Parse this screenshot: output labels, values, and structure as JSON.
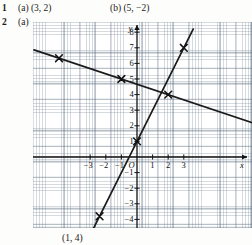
{
  "page": {
    "width": 252,
    "height": 245,
    "background": "#fdfdfb",
    "ink": "#1a1a1a"
  },
  "exercises": [
    {
      "number": "1",
      "parts": [
        {
          "label": "(a)",
          "answer": "(3, 2)"
        },
        {
          "label": "(b)",
          "answer": "(5, −2)"
        }
      ]
    },
    {
      "number": "2",
      "parts": [
        {
          "label": "(a)",
          "answer": ""
        }
      ]
    }
  ],
  "caption": "(1, 4)",
  "chart_data": {
    "type": "line",
    "title": "",
    "xlabel": "x",
    "ylabel": "y",
    "grid": true,
    "grid_minor_step": 0.2,
    "grid_major_step": 1,
    "legend": "none",
    "xlim": [
      -6.6,
      7.4
    ],
    "ylim": [
      -4.6,
      8.6
    ],
    "origin_label": "O",
    "xticks": [
      -3,
      -2,
      -1,
      1,
      2,
      3
    ],
    "xtick_labels": [
      "−3",
      "−2",
      "−1",
      "1",
      "2",
      "3"
    ],
    "yticks": [
      1,
      2,
      3,
      4,
      5,
      6,
      7,
      8,
      -1,
      -2,
      -3,
      -4
    ],
    "ytick_labels": [
      "1",
      "2",
      "3",
      "4",
      "5",
      "6",
      "7",
      "8",
      "−1",
      "−2",
      "−3",
      "−4"
    ],
    "axis_arrows": [
      "x-positive",
      "y-positive"
    ],
    "series": [
      {
        "name": "descending-line",
        "type": "line",
        "slope": -0.3333,
        "intercept": 4.6667,
        "x": [
          -6.6,
          7.4
        ],
        "y": [
          6.87,
          2.2
        ],
        "marked_points": [
          {
            "x": -5,
            "y": 6.33,
            "marker": "cross"
          },
          {
            "x": -1,
            "y": 5.0,
            "marker": "cross"
          },
          {
            "x": 2,
            "y": 4.0,
            "marker": "cross"
          }
        ]
      },
      {
        "name": "ascending-line",
        "type": "line",
        "slope": 2.0,
        "intercept": 1.0,
        "x": [
          -2.8,
          3.6
        ],
        "y": [
          -4.6,
          8.2
        ],
        "marked_points": [
          {
            "x": 0,
            "y": 1.0,
            "marker": "cross"
          },
          {
            "x": 3,
            "y": 7.0,
            "marker": "cross"
          },
          {
            "x": -2.4,
            "y": -3.8,
            "marker": "cross"
          }
        ]
      }
    ]
  }
}
